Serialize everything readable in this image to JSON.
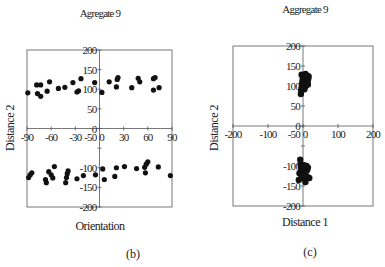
{
  "chart_data": [
    {
      "type": "scatter",
      "panel_label": "(b)",
      "title": "Agregate 9",
      "xlabel": "Orientation",
      "ylabel": "Distance 2",
      "xlim": [
        -90,
        90
      ],
      "ylim": [
        -200,
        200
      ],
      "xticks": [
        -90,
        -60,
        -30,
        0,
        30,
        60,
        90
      ],
      "xtick_labels": [
        "-90",
        "-60",
        "-30",
        "0",
        "30",
        "60",
        "90"
      ],
      "yticks": [
        200,
        150,
        100,
        50,
        0,
        -50,
        -100,
        -150,
        -200
      ],
      "ytick_labels": [
        "200",
        "150",
        "100",
        "50",
        "0",
        "-50",
        "-100",
        "-150",
        "-200"
      ],
      "grid": false,
      "series": [
        {
          "name": "cluster-upper",
          "points": [
            [
              -89,
              91
            ],
            [
              -78,
              111
            ],
            [
              -73,
              111
            ],
            [
              -77,
              89
            ],
            [
              -73,
              82
            ],
            [
              -65,
              95
            ],
            [
              -62,
              119
            ],
            [
              -51,
              102
            ],
            [
              -43,
              105
            ],
            [
              -33,
              117
            ],
            [
              -28,
              93
            ],
            [
              -26,
              96
            ],
            [
              -23,
              127
            ],
            [
              -6,
              117
            ],
            [
              3,
              92
            ],
            [
              12,
              119
            ],
            [
              21,
              106
            ],
            [
              22,
              125
            ],
            [
              23,
              130
            ],
            [
              40,
              104
            ],
            [
              48,
              128
            ],
            [
              50,
              119
            ],
            [
              67,
              98
            ],
            [
              67,
              127
            ],
            [
              69,
              130
            ],
            [
              74,
              104
            ]
          ]
        },
        {
          "name": "cluster-lower",
          "points": [
            [
              -88,
              -125
            ],
            [
              -86,
              -118
            ],
            [
              -84,
              -113
            ],
            [
              -67,
              -130
            ],
            [
              -66,
              -138
            ],
            [
              -63,
              -110
            ],
            [
              -60,
              -118
            ],
            [
              -58,
              -126
            ],
            [
              -56,
              -97
            ],
            [
              -42,
              -138
            ],
            [
              -41,
              -125
            ],
            [
              -40,
              -115
            ],
            [
              -39,
              -108
            ],
            [
              -28,
              -128
            ],
            [
              -20,
              -120
            ],
            [
              -5,
              -118
            ],
            [
              4,
              -103
            ],
            [
              6,
              -130
            ],
            [
              19,
              -122
            ],
            [
              21,
              -100
            ],
            [
              31,
              -97
            ],
            [
              46,
              -102
            ],
            [
              56,
              -99
            ],
            [
              57,
              -113
            ],
            [
              58,
              -91
            ],
            [
              60,
              -85
            ],
            [
              73,
              -98
            ],
            [
              88,
              -120
            ]
          ]
        }
      ]
    },
    {
      "type": "scatter",
      "panel_label": "(c)",
      "title": "Aggregate 9",
      "xlabel": "Distance 1",
      "ylabel": "Distance 2",
      "xlim": [
        -200,
        200
      ],
      "ylim": [
        -200,
        200
      ],
      "xticks": [
        -200,
        -100,
        0,
        100,
        200
      ],
      "xtick_labels": [
        "-200",
        "-100",
        "0",
        "100",
        "200"
      ],
      "yticks": [
        200,
        150,
        100,
        50,
        0,
        -50,
        -100,
        -150,
        -200
      ],
      "ytick_labels": [
        "200",
        "150",
        "100",
        "50",
        "0",
        "-50",
        "-100",
        "-150",
        "-200"
      ],
      "grid": false,
      "series": [
        {
          "name": "cluster-upper",
          "points": [
            [
              -6,
              80
            ],
            [
              -5,
              88
            ],
            [
              -4,
              95
            ],
            [
              -3,
              102
            ],
            [
              -2,
              108
            ],
            [
              -4,
              128
            ],
            [
              -1,
              115
            ],
            [
              0,
              120
            ],
            [
              1,
              98
            ],
            [
              2,
              105
            ],
            [
              3,
              112
            ],
            [
              4,
              92
            ],
            [
              5,
              118
            ],
            [
              6,
              125
            ],
            [
              7,
              130
            ],
            [
              8,
              100
            ],
            [
              9,
              108
            ],
            [
              10,
              115
            ],
            [
              11,
              120
            ],
            [
              12,
              126
            ],
            [
              13,
              110
            ],
            [
              14,
              104
            ],
            [
              15,
              118
            ],
            [
              16,
              124
            ]
          ]
        },
        {
          "name": "cluster-lower",
          "points": [
            [
              -8,
              -84
            ],
            [
              -7,
              -95
            ],
            [
              -6,
              -102
            ],
            [
              -10,
              -118
            ],
            [
              -5,
              -110
            ],
            [
              -12,
              -135
            ],
            [
              -4,
              -125
            ],
            [
              -3,
              -100
            ],
            [
              -2,
              -115
            ],
            [
              0,
              -108
            ],
            [
              1,
              -130
            ],
            [
              2,
              -120
            ],
            [
              3,
              -98
            ],
            [
              5,
              -105
            ],
            [
              6,
              -118
            ],
            [
              7,
              -140
            ],
            [
              8,
              -112
            ],
            [
              10,
              -100
            ],
            [
              11,
              -126
            ],
            [
              12,
              -110
            ],
            [
              14,
              -104
            ],
            [
              18,
              -130
            ]
          ]
        }
      ]
    }
  ]
}
